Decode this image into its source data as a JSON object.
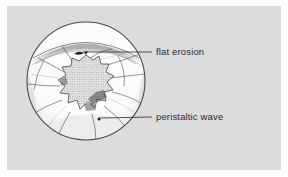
{
  "figure": {
    "type": "medical-illustration",
    "panel_background_color": "#dcdcdc",
    "page_background_color": "#ffffff",
    "ink_color": "#2b2b2b"
  },
  "scope_view": {
    "shape": "circle",
    "center_x": 86,
    "center_y": 81,
    "radius": 59,
    "rim_texture": "stippled-hatched",
    "lesion": {
      "name": "stellate-stippled-lesion",
      "description": "irregular star-shaped stippled central mass"
    },
    "folds": "radiating mucosal folds"
  },
  "annotations": [
    {
      "id": "flat-erosion",
      "label": "flat erosion",
      "marker": "dark-flat-mark",
      "marker_x": 80,
      "marker_y": 53,
      "leader_to_x": 152,
      "leader_to_y": 52,
      "text_x": 156,
      "text_y": 47
    },
    {
      "id": "peristaltic-wave",
      "label": "peristaltic wave",
      "marker": "dot",
      "marker_x": 99,
      "marker_y": 119,
      "leader_to_x": 152,
      "leader_to_y": 117,
      "text_x": 156,
      "text_y": 112
    }
  ]
}
